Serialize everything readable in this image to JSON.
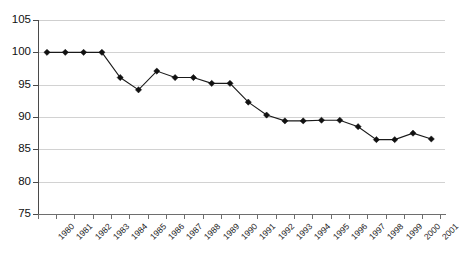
{
  "chart_data": {
    "type": "line",
    "title": "",
    "subtitle": "",
    "xlabel": "",
    "ylabel": "",
    "categories": [
      "1980",
      "1981",
      "1982",
      "1983",
      "1984",
      "1985",
      "1986",
      "1987",
      "1988",
      "1989",
      "1990",
      "1991",
      "1992",
      "1993",
      "1994",
      "1995",
      "1996",
      "1997",
      "1998",
      "1999",
      "2000",
      "2001"
    ],
    "values": [
      100.0,
      100.0,
      100.0,
      100.0,
      96.1,
      94.2,
      97.1,
      96.1,
      96.1,
      95.2,
      95.2,
      92.3,
      90.3,
      89.4,
      89.4,
      89.5,
      89.5,
      88.5,
      86.5,
      86.5,
      87.5,
      86.6
    ],
    "series": [
      {
        "name": "Index",
        "values": [
          100.0,
          100.0,
          100.0,
          100.0,
          96.1,
          94.2,
          97.1,
          96.1,
          96.1,
          95.2,
          95.2,
          92.3,
          90.3,
          89.4,
          89.4,
          89.5,
          89.5,
          88.5,
          86.5,
          86.5,
          87.5,
          86.6
        ]
      }
    ],
    "ylim": [
      75,
      105
    ],
    "yticks": [
      75,
      80,
      85,
      90,
      95,
      100,
      105
    ],
    "ytick_labels": [
      "75",
      "80",
      "85",
      "90",
      "95",
      "100",
      "105"
    ],
    "grid": true,
    "grid_axis": "y",
    "legend": false,
    "legend_position": "none",
    "marker": "diamond",
    "marker_color": "#111111",
    "line_color": "#1a1a1a",
    "grid_color": "#d2d2d2",
    "axis_color": "#4a4a4a",
    "background_color": "#ffffff",
    "annotations": []
  }
}
